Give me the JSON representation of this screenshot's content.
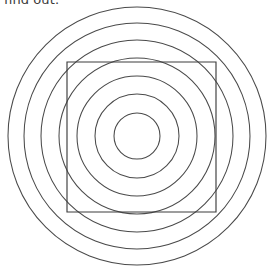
{
  "canvas": {
    "width": 274,
    "height": 274,
    "background": "#ffffff"
  },
  "caption": {
    "text": "find out.",
    "color": "#3a3a3a",
    "clipped_top": true
  },
  "figure": {
    "stroke_color": "#4a4a4a",
    "square_stroke_color": "#3d3d3d",
    "stroke_width": 1.05,
    "center": {
      "x": 137,
      "y": 136
    },
    "circles": [
      {
        "name": "circle-1-innermost",
        "r": 23
      },
      {
        "name": "circle-2",
        "r": 42
      },
      {
        "name": "circle-3",
        "r": 60
      },
      {
        "name": "circle-4",
        "r": 78
      },
      {
        "name": "circle-5",
        "r": 96
      },
      {
        "name": "circle-6",
        "r": 113
      },
      {
        "name": "circle-7-outermost",
        "r": 129
      }
    ],
    "square": {
      "name": "inscribed-square",
      "x": 67,
      "y": 62,
      "width": 149,
      "height": 150
    }
  },
  "chart_data": {
    "type": "scatter",
    "xlabel": "",
    "ylabel": "",
    "series": [
      {
        "name": "circle radii (px)",
        "values": [
          23,
          42,
          60,
          78,
          96,
          113,
          129
        ]
      }
    ],
    "annotations": [
      "find out."
    ]
  }
}
